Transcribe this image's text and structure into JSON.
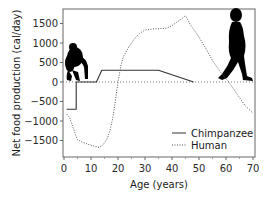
{
  "chart_data": {
    "type": "line",
    "title": "",
    "xlabel": "Age (years)",
    "ylabel": "Net food production (cal/day)",
    "xlim": [
      -1,
      71
    ],
    "ylim": [
      -1900,
      1900
    ],
    "xticks": [
      0,
      10,
      20,
      30,
      40,
      50,
      60,
      70
    ],
    "yticks": [
      1500,
      1000,
      500,
      0,
      -500,
      -1000,
      -1500
    ],
    "xtick_labels": [
      "0",
      "10",
      "20",
      "30",
      "40",
      "50",
      "60",
      "70"
    ],
    "ytick_labels": [
      "1500",
      "1000",
      "500",
      "0",
      "−500",
      "−1000",
      "−1500"
    ],
    "grid": false,
    "zero_line": true,
    "legend_position": "lower right",
    "series": [
      {
        "name": "Chimpanzee",
        "style": "solid",
        "color": "#333333",
        "x": [
          1,
          4.5,
          4.5,
          12,
          14,
          35,
          48
        ],
        "y": [
          -700,
          -700,
          0,
          0,
          300,
          300,
          0
        ]
      },
      {
        "name": "Human",
        "style": "dotted",
        "color": "#555555",
        "x": [
          1,
          2,
          3,
          4,
          5,
          7,
          9,
          11,
          13,
          14,
          15,
          16,
          17,
          18,
          19,
          20,
          21,
          22,
          24,
          26,
          28,
          30,
          33,
          36,
          38,
          40,
          42,
          45,
          47,
          50,
          53,
          55,
          58,
          60,
          61,
          63,
          65,
          67,
          70
        ],
        "y": [
          -820,
          -900,
          -1100,
          -1300,
          -1480,
          -1550,
          -1600,
          -1640,
          -1680,
          -1640,
          -1560,
          -1450,
          -1250,
          -950,
          -500,
          0,
          400,
          650,
          900,
          1100,
          1250,
          1330,
          1360,
          1370,
          1380,
          1450,
          1540,
          1700,
          1450,
          1150,
          800,
          550,
          250,
          80,
          0,
          -200,
          -400,
          -600,
          -800
        ]
      }
    ],
    "annotations": [
      "chimpanzee-silhouette (upper left near age 0-5)",
      "human-silhouette (upper right near age 58-70)"
    ]
  },
  "legend": {
    "items": [
      {
        "label": "Chimpanzee",
        "style": "solid"
      },
      {
        "label": "Human",
        "style": "dotted"
      }
    ]
  },
  "axes": {
    "xlabel": "Age (years)",
    "ylabel": "Net food production (cal/day)"
  },
  "colors": {
    "frame": "#555555",
    "chimp_line": "#3a3a3a",
    "human_line": "#5a5a5a",
    "silhouette": "#000000"
  }
}
